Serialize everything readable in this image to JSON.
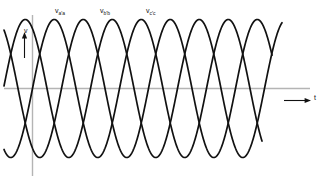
{
  "figure": {
    "title": "",
    "background_color": "#ffffff",
    "axis_color": "#b4b4b4",
    "curve_color": "#111111"
  },
  "axes": {
    "y_axis_label": "v",
    "x_axis_label": "t",
    "y_axis_arrow": "up-arrow",
    "x_axis_arrow": "right-arrow"
  },
  "labels": {
    "phase_a": {
      "symbol": "v",
      "subscript": "a′a"
    },
    "phase_b": {
      "symbol": "v",
      "subscript": "b′b"
    },
    "phase_c": {
      "symbol": "v",
      "subscript": "c′c"
    }
  },
  "chart_data": {
    "type": "line",
    "title": "",
    "xlabel": "t",
    "ylabel": "v",
    "grid": false,
    "legend_position": "above-curves",
    "xlim": [
      0,
      360
    ],
    "ylim": [
      -1.08,
      1.08
    ],
    "x_tick_labels": [],
    "y_tick_labels": [],
    "annotations": [
      {
        "text": "v_a′a",
        "x": 34,
        "y": 1.0
      },
      {
        "text": "v_b′b",
        "x": 82,
        "y": 1.0
      },
      {
        "text": "v_c′c",
        "x": 130,
        "y": 1.0
      }
    ],
    "waveform": {
      "amplitude": 1.0,
      "period_degrees": 360,
      "phase_offsets_degrees": [
        0,
        -120,
        -240
      ],
      "cycles_shown": 2.6
    },
    "series": [
      {
        "name": "v_a′a",
        "color": "#111111",
        "phase_degrees": 0,
        "amplitude": 1.0,
        "values": [
          0.64,
          0.99,
          0.87,
          0.34,
          -0.34,
          -0.87,
          -0.99,
          -0.64,
          0.0,
          0.64,
          0.99,
          0.87,
          0.34,
          -0.34,
          -0.87,
          -0.99,
          -0.64,
          0.0,
          0.64,
          0.99,
          0.87,
          0.34,
          -0.34,
          -0.87,
          -0.99
        ]
      },
      {
        "name": "v_b′b",
        "color": "#111111",
        "phase_degrees": -120,
        "amplitude": 1.0,
        "values": [
          -0.99,
          -0.64,
          0.0,
          0.64,
          0.99,
          0.87,
          0.34,
          -0.34,
          -0.87,
          -0.99,
          -0.64,
          0.0,
          0.64,
          0.99,
          0.87,
          0.34,
          -0.34,
          -0.87,
          -0.99,
          -0.64,
          0.0,
          0.64,
          0.99,
          0.87,
          0.34
        ]
      },
      {
        "name": "v_c′c",
        "color": "#111111",
        "phase_degrees": -240,
        "amplitude": 1.0,
        "values": [
          0.34,
          -0.34,
          -0.87,
          -0.99,
          -0.64,
          0.0,
          0.64,
          0.99,
          0.87,
          0.34,
          -0.34,
          -0.87,
          -0.99,
          -0.64,
          0.0,
          0.64,
          0.99,
          0.87,
          0.34,
          -0.34,
          -0.87,
          -0.99,
          -0.64,
          0.0,
          0.64
        ]
      }
    ]
  }
}
